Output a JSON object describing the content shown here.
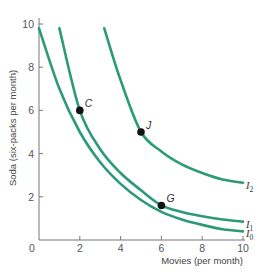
{
  "chart_data": {
    "type": "line",
    "title": "",
    "xlabel": "Movies (per month)",
    "ylabel": "Soda (six-packs per month)",
    "xlim": [
      0,
      10
    ],
    "ylim": [
      0,
      10
    ],
    "grid": false,
    "x_ticks": [
      "0",
      "2",
      "4",
      "6",
      "8",
      "10"
    ],
    "y_ticks": [
      "2",
      "4",
      "6",
      "8",
      "10"
    ],
    "curve_color": "#2a9a78",
    "series": [
      {
        "name": "I0",
        "label_main": "I",
        "label_sub": "0",
        "points": [
          [
            0.0,
            9.8
          ],
          [
            1,
            7.0
          ],
          [
            2,
            5.0
          ],
          [
            3,
            3.6
          ],
          [
            4,
            2.6
          ],
          [
            5,
            1.85
          ],
          [
            6,
            1.3
          ],
          [
            7,
            0.95
          ],
          [
            8,
            0.7
          ],
          [
            9,
            0.5
          ],
          [
            10,
            0.4
          ]
        ]
      },
      {
        "name": "I1",
        "label_main": "I",
        "label_sub": "1",
        "points": [
          [
            1.0,
            9.8
          ],
          [
            2,
            6.0
          ],
          [
            3,
            4.2
          ],
          [
            4,
            3.1
          ],
          [
            5,
            2.3
          ],
          [
            6,
            1.6
          ],
          [
            7,
            1.3
          ],
          [
            8,
            1.1
          ],
          [
            9,
            0.95
          ],
          [
            10,
            0.85
          ]
        ]
      },
      {
        "name": "I2",
        "label_main": "I",
        "label_sub": "2",
        "points": [
          [
            3.2,
            9.8
          ],
          [
            4,
            7.4
          ],
          [
            5,
            5.0
          ],
          [
            6,
            4.1
          ],
          [
            7,
            3.5
          ],
          [
            8,
            3.1
          ],
          [
            9,
            2.8
          ],
          [
            10,
            2.65
          ]
        ]
      }
    ],
    "annotations": [
      {
        "label": "C",
        "x": 2,
        "y": 6
      },
      {
        "label": "J",
        "x": 5,
        "y": 5
      },
      {
        "label": "G",
        "x": 6,
        "y": 1.6
      }
    ]
  }
}
